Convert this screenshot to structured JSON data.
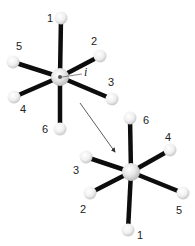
{
  "diagram": {
    "type": "octahedral-inversion",
    "colors": {
      "bond": "#0d0d0d",
      "sphere_light": "#ffffff",
      "sphere_dark": "#cfcfcf",
      "center_dot": "#555555",
      "arrow": "#333333"
    },
    "top_molecule": {
      "center": [
        60,
        77
      ],
      "center_label": "i",
      "ligands": [
        {
          "label": "1",
          "pos": [
            61,
            18
          ],
          "label_pos": [
            47,
            22
          ]
        },
        {
          "label": "2",
          "pos": [
            100,
            56
          ],
          "label_pos": [
            91,
            45
          ]
        },
        {
          "label": "3",
          "pos": [
            112,
            99
          ],
          "label_pos": [
            108,
            86
          ]
        },
        {
          "label": "4",
          "pos": [
            14,
            97
          ],
          "label_pos": [
            20,
            113
          ]
        },
        {
          "label": "5",
          "pos": [
            13,
            62
          ],
          "label_pos": [
            16,
            50
          ]
        },
        {
          "label": "6",
          "pos": [
            60,
            129
          ],
          "label_pos": [
            42,
            133
          ]
        }
      ]
    },
    "bottom_molecule": {
      "center": [
        131,
        172
      ],
      "ligands": [
        {
          "label": "1",
          "pos": [
            128,
            230
          ],
          "label_pos": [
            137,
            239
          ]
        },
        {
          "label": "2",
          "pos": [
            90,
            193
          ],
          "label_pos": [
            80,
            213
          ]
        },
        {
          "label": "3",
          "pos": [
            86,
            157
          ],
          "label_pos": [
            73,
            174
          ]
        },
        {
          "label": "4",
          "pos": [
            170,
            150
          ],
          "label_pos": [
            165,
            141
          ]
        },
        {
          "label": "5",
          "pos": [
            183,
            193
          ],
          "label_pos": [
            176,
            214
          ]
        },
        {
          "label": "6",
          "pos": [
            130,
            118
          ],
          "label_pos": [
            143,
            124
          ]
        }
      ]
    },
    "arrow": {
      "from": [
        80,
        103
      ],
      "to": [
        115,
        152
      ]
    }
  }
}
